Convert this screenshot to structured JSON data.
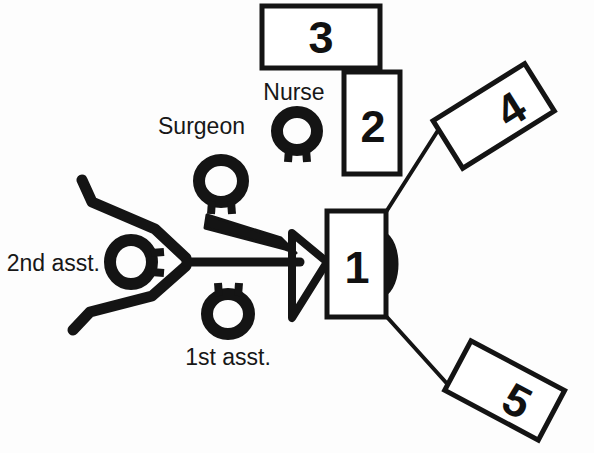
{
  "diagram": {
    "background_color": "#fdfdfd",
    "ink_color": "#141414",
    "labels": {
      "surgeon": "Surgeon",
      "nurse": "Nurse",
      "first_assistant": "1st asst.",
      "second_assistant": "2nd asst."
    },
    "equipment_boxes": [
      {
        "id": "box-1",
        "number": "1",
        "orientation": "upright"
      },
      {
        "id": "box-2",
        "number": "2",
        "orientation": "upright"
      },
      {
        "id": "box-3",
        "number": "3",
        "orientation": "upright"
      },
      {
        "id": "box-4",
        "number": "4",
        "orientation": "rotated"
      },
      {
        "id": "box-5",
        "number": "5",
        "orientation": "rotated"
      }
    ]
  }
}
